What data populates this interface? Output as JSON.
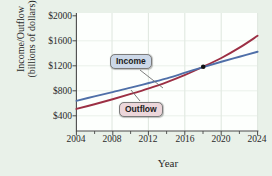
{
  "chart_data": {
    "type": "line",
    "title": "",
    "xlabel": "Year",
    "ylabel_line1": "Income/Outflow",
    "ylabel_line2": "(billions of dollars)",
    "xlim": [
      2004,
      2024
    ],
    "ylim": [
      200,
      2000
    ],
    "grid": true,
    "legend_position": "inline-callouts",
    "xticks": [
      "2004",
      "2008",
      "2012",
      "2016",
      "2020",
      "2024"
    ],
    "xtick_values": [
      2004,
      2008,
      2012,
      2016,
      2020,
      2024
    ],
    "xminor_values": [
      2006,
      2010,
      2014,
      2018,
      2022
    ],
    "yticks": [
      "$400",
      "$800",
      "$1200",
      "$1600",
      "$2000"
    ],
    "ytick_values": [
      400,
      800,
      1200,
      1600,
      2000
    ],
    "x": [
      2004,
      2006,
      2008,
      2010,
      2012,
      2014,
      2016,
      2018,
      2020,
      2022,
      2024
    ],
    "series": [
      {
        "name": "Income",
        "color": "#4f6fa8",
        "values": [
          640,
          710,
          780,
          850,
          925,
          1000,
          1090,
          1180,
          1265,
          1345,
          1425
        ]
      },
      {
        "name": "Outflow",
        "color": "#9c2f44",
        "values": [
          510,
          585,
          665,
          750,
          840,
          940,
          1055,
          1185,
          1325,
          1490,
          1680
        ]
      }
    ],
    "annotations": [
      {
        "name": "Income",
        "label": "Income",
        "x": 2012,
        "y": 1200,
        "point_x": 2016.2,
        "point_y": 1085
      },
      {
        "name": "Outflow",
        "label": "Outflow",
        "x": 2013,
        "y": 600,
        "point_x": 2011.2,
        "point_y": 805
      }
    ],
    "intersection": {
      "x": 2018,
      "y": 1185,
      "marker": "filled-circle",
      "color": "#111111"
    }
  },
  "style": {
    "background": "#e9f1e9",
    "plot_background": "#fdfffd",
    "grid_color": "#d2ddd2",
    "axis_color": "#4a4a4a",
    "text_color": "#2a2a2a"
  }
}
